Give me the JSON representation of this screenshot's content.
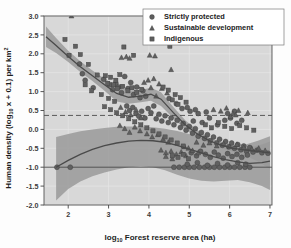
{
  "chart_data": {
    "type": "scatter",
    "title": "",
    "xlabel": "log10 Forest reserve area (ha)",
    "xlabel_main": "log",
    "xlabel_sub": "10",
    "xlabel_rest": " Forest reserve area (ha)",
    "ylabel": "Human density (log10 x + 0.1) per km2",
    "ylabel_part1": "Human density (log",
    "ylabel_sub1": "10",
    "ylabel_part2": " x + 0.1) per km",
    "ylabel_sup": "2",
    "xlim": [
      1.4,
      7.05
    ],
    "ylim": [
      -2.0,
      3.0
    ],
    "xticks": [
      2,
      3,
      4,
      5,
      6,
      7
    ],
    "xtick_labels": [
      "2",
      "3",
      "4",
      "5",
      "6",
      "7"
    ],
    "yticks": [
      -2.0,
      -1.5,
      -1.0,
      -0.5,
      0.0,
      0.5,
      1.0,
      1.5,
      2.0,
      2.5,
      3.0
    ],
    "ytick_labels": [
      "-2.0",
      "-1.5",
      "-1.0",
      "-0.5",
      "0.0",
      "0.5",
      "1.0",
      "1.5",
      "2.0",
      "2.5",
      "3.0"
    ],
    "grid": true,
    "grid_color": "#e8e8e8",
    "plot_bg": "#d8d8d8",
    "legend_position": "top-right",
    "reference_lines": [
      {
        "name": "density-threshold",
        "type": "dashed",
        "y": 0.37,
        "color": "#4a4a4a"
      },
      {
        "name": "zero-density-floor",
        "type": "solid",
        "y": -1.0,
        "color": "#4a4a4a"
      }
    ],
    "legend": [
      {
        "label": "Strictly protected",
        "marker": "circle",
        "color": "#5e5e5e"
      },
      {
        "label": "Sustainable development",
        "marker": "triangle",
        "color": "#5e5e5e"
      },
      {
        "label": "Indigenous",
        "marker": "square",
        "color": "#5e5e5e"
      }
    ],
    "band_color": "#9a9a9a",
    "line_color": "#4a4a4a",
    "trend_upper": {
      "name": "upper-trend",
      "x": [
        1.45,
        1.7,
        2.0,
        2.3,
        2.6,
        2.9,
        3.2,
        3.5,
        3.8,
        4.05,
        4.3,
        4.6,
        4.9,
        5.2,
        5.5,
        5.8,
        6.1,
        6.4,
        6.7,
        7.0
      ],
      "y": [
        2.45,
        2.22,
        1.93,
        1.66,
        1.42,
        1.18,
        0.95,
        0.85,
        0.88,
        0.93,
        0.8,
        0.45,
        0.12,
        -0.12,
        -0.3,
        -0.42,
        -0.5,
        -0.55,
        -0.58,
        -0.62
      ],
      "ci_lo": [
        2.18,
        2.02,
        1.78,
        1.52,
        1.28,
        1.02,
        0.74,
        0.68,
        0.72,
        0.76,
        0.62,
        0.3,
        0.0,
        -0.22,
        -0.38,
        -0.5,
        -0.6,
        -0.7,
        -0.85,
        -1.05
      ],
      "ci_hi": [
        2.72,
        2.42,
        2.08,
        1.8,
        1.56,
        1.34,
        1.16,
        1.02,
        1.04,
        1.1,
        0.98,
        0.6,
        0.24,
        -0.02,
        -0.22,
        -0.34,
        -0.4,
        -0.4,
        -0.3,
        -0.18
      ]
    },
    "trend_lower": {
      "name": "lower-trend",
      "x": [
        1.7,
        2.0,
        2.3,
        2.6,
        2.9,
        3.2,
        3.5,
        3.8,
        4.1,
        4.4,
        4.7,
        5.0,
        5.3,
        5.6,
        5.9,
        6.2,
        6.5,
        6.8,
        7.0
      ],
      "y": [
        -1.0,
        -0.82,
        -0.66,
        -0.53,
        -0.43,
        -0.36,
        -0.31,
        -0.29,
        -0.3,
        -0.34,
        -0.42,
        -0.52,
        -0.62,
        -0.72,
        -0.8,
        -0.86,
        -0.9,
        -0.88,
        -0.84
      ],
      "ci_lo": [
        -1.88,
        -1.58,
        -1.38,
        -1.24,
        -1.14,
        -1.06,
        -1.0,
        -0.98,
        -1.0,
        -1.08,
        -1.2,
        -1.3,
        -1.36,
        -1.38,
        -1.36,
        -1.34,
        -1.4,
        -1.5,
        -1.6
      ],
      "ci_hi": [
        -0.2,
        -0.12,
        -0.05,
        0.0,
        0.04,
        0.07,
        0.08,
        0.08,
        0.06,
        0.02,
        -0.04,
        -0.12,
        -0.22,
        -0.34,
        -0.44,
        -0.5,
        -0.48,
        -0.4,
        -0.32
      ]
    },
    "series": [
      {
        "name": "Strictly protected",
        "marker": "circle",
        "points": [
          [
            1.72,
            -1.0
          ],
          [
            2.05,
            -1.0
          ],
          [
            2.28,
            1.73
          ],
          [
            2.35,
            1.47
          ],
          [
            2.42,
            1.3
          ],
          [
            2.62,
            1.1
          ],
          [
            2.88,
            1.33
          ],
          [
            3.02,
            1.18
          ],
          [
            3.1,
            1.05
          ],
          [
            3.18,
            1.22
          ],
          [
            3.25,
            1.12
          ],
          [
            3.32,
            0.97
          ],
          [
            3.4,
            1.4
          ],
          [
            3.48,
            1.08
          ],
          [
            3.55,
            1.24
          ],
          [
            3.62,
            0.92
          ],
          [
            3.7,
            1.12
          ],
          [
            3.78,
            0.84
          ],
          [
            3.85,
            1.02
          ],
          [
            3.92,
            0.88
          ],
          [
            3.45,
            0.62
          ],
          [
            3.52,
            0.5
          ],
          [
            3.6,
            0.58
          ],
          [
            3.68,
            0.42
          ],
          [
            3.75,
            0.35
          ],
          [
            3.82,
            0.48
          ],
          [
            3.9,
            0.3
          ],
          [
            3.98,
            0.55
          ],
          [
            4.05,
            0.44
          ],
          [
            4.12,
            0.62
          ],
          [
            4.18,
            0.28
          ],
          [
            4.25,
            0.4
          ],
          [
            4.32,
            0.22
          ],
          [
            4.4,
            0.36
          ],
          [
            4.48,
            0.18
          ],
          [
            4.55,
            0.3
          ],
          [
            4.62,
            0.12
          ],
          [
            4.7,
            0.24
          ],
          [
            4.78,
            0.05
          ],
          [
            4.85,
            0.16
          ],
          [
            4.92,
            -0.02
          ],
          [
            5.0,
            0.08
          ],
          [
            5.08,
            -0.1
          ],
          [
            5.15,
            0.02
          ],
          [
            5.22,
            -0.18
          ],
          [
            5.3,
            -0.08
          ],
          [
            5.38,
            -0.24
          ],
          [
            5.45,
            -0.14
          ],
          [
            5.52,
            -0.3
          ],
          [
            5.6,
            -0.2
          ],
          [
            5.68,
            -0.36
          ],
          [
            5.75,
            -0.26
          ],
          [
            5.82,
            -0.42
          ],
          [
            5.9,
            -0.32
          ],
          [
            5.98,
            -0.46
          ],
          [
            6.05,
            -0.36
          ],
          [
            6.12,
            -0.5
          ],
          [
            6.2,
            -0.4
          ],
          [
            6.28,
            -0.54
          ],
          [
            6.35,
            -0.44
          ],
          [
            6.42,
            -0.58
          ],
          [
            6.5,
            -0.48
          ],
          [
            6.58,
            -0.6
          ],
          [
            6.68,
            -0.55
          ],
          [
            6.8,
            -0.62
          ],
          [
            6.95,
            -0.63
          ],
          [
            4.62,
            -1.0
          ],
          [
            4.75,
            -1.0
          ],
          [
            4.88,
            -1.0
          ],
          [
            5.0,
            -1.0
          ],
          [
            5.12,
            -1.0
          ],
          [
            5.25,
            -1.0
          ],
          [
            5.38,
            -1.0
          ],
          [
            5.5,
            -1.0
          ],
          [
            5.62,
            -1.0
          ],
          [
            5.75,
            -1.0
          ],
          [
            5.88,
            -1.0
          ],
          [
            6.0,
            -1.0
          ],
          [
            6.12,
            -1.0
          ],
          [
            6.25,
            -1.0
          ],
          [
            6.38,
            -1.0
          ],
          [
            6.5,
            -1.0
          ],
          [
            4.95,
            -0.92
          ],
          [
            5.2,
            -0.88
          ],
          [
            5.45,
            -0.95
          ],
          [
            5.7,
            -0.9
          ],
          [
            5.95,
            -0.94
          ],
          [
            6.2,
            -0.88
          ],
          [
            6.4,
            -0.92
          ],
          [
            5.05,
            -0.62
          ],
          [
            5.18,
            -0.7
          ],
          [
            5.28,
            -0.58
          ],
          [
            5.4,
            -0.66
          ],
          [
            5.52,
            -0.74
          ],
          [
            5.62,
            -0.6
          ],
          [
            5.72,
            -0.68
          ],
          [
            5.84,
            -0.76
          ],
          [
            5.95,
            -0.64
          ],
          [
            6.06,
            -0.72
          ],
          [
            6.18,
            -0.66
          ],
          [
            6.3,
            -0.74
          ],
          [
            6.44,
            -0.68
          ],
          [
            5.1,
            0.22
          ],
          [
            5.32,
            0.18
          ],
          [
            5.5,
            0.3
          ],
          [
            5.7,
            0.12
          ],
          [
            5.88,
            0.24
          ],
          [
            6.02,
            0.3
          ],
          [
            6.18,
            0.16
          ],
          [
            5.95,
            0.42
          ],
          [
            6.12,
            0.48
          ],
          [
            6.3,
            0.24
          ],
          [
            4.5,
            0.82
          ],
          [
            4.68,
            0.68
          ],
          [
            4.82,
            0.55
          ],
          [
            5.02,
            0.48
          ],
          [
            5.22,
            0.42
          ],
          [
            4.95,
            0.58
          ],
          [
            5.15,
            0.52
          ],
          [
            5.42,
            0.46
          ]
        ]
      },
      {
        "name": "Sustainable development",
        "marker": "triangle",
        "points": [
          [
            2.08,
            3.0
          ],
          [
            3.32,
            1.9
          ],
          [
            3.44,
            1.92
          ],
          [
            3.52,
            1.88
          ],
          [
            4.02,
            1.96
          ],
          [
            4.15,
            1.94
          ],
          [
            4.55,
            1.58
          ],
          [
            3.98,
            1.3
          ],
          [
            4.12,
            1.34
          ],
          [
            4.25,
            1.2
          ],
          [
            4.32,
            1.08
          ],
          [
            4.05,
            1.1
          ],
          [
            3.88,
            1.24
          ],
          [
            4.45,
            0.96
          ],
          [
            4.18,
            0.88
          ],
          [
            3.3,
            0.58
          ],
          [
            3.42,
            0.46
          ],
          [
            3.55,
            0.38
          ],
          [
            3.68,
            0.52
          ],
          [
            3.8,
            0.3
          ],
          [
            3.28,
            0.1
          ],
          [
            3.4,
            0.02
          ],
          [
            3.52,
            -0.08
          ],
          [
            3.65,
            0.06
          ],
          [
            3.78,
            -0.04
          ],
          [
            3.95,
            -0.12
          ],
          [
            4.08,
            -0.2
          ],
          [
            4.22,
            -0.14
          ],
          [
            4.35,
            -0.26
          ],
          [
            4.48,
            -0.34
          ],
          [
            4.3,
            -0.55
          ],
          [
            4.42,
            -0.62
          ],
          [
            4.55,
            -0.58
          ],
          [
            4.68,
            -0.66
          ],
          [
            4.8,
            -0.6
          ],
          [
            4.92,
            -0.7
          ],
          [
            4.42,
            -0.72
          ],
          [
            4.58,
            -0.78
          ],
          [
            5.6,
            0.52
          ],
          [
            5.78,
            0.48
          ],
          [
            5.92,
            0.56
          ],
          [
            6.08,
            0.42
          ],
          [
            6.22,
            0.5
          ],
          [
            6.45,
            0.44
          ],
          [
            6.02,
            0.34
          ],
          [
            6.15,
            0.38
          ],
          [
            5.18,
            -0.34
          ],
          [
            5.35,
            -0.42
          ],
          [
            5.5,
            -0.36
          ],
          [
            5.68,
            -0.44
          ],
          [
            5.85,
            -0.38
          ],
          [
            6.0,
            -0.46
          ],
          [
            6.18,
            -0.4
          ],
          [
            6.35,
            -0.48
          ],
          [
            6.55,
            -0.52
          ],
          [
            6.72,
            -0.5
          ],
          [
            6.88,
            -0.56
          ],
          [
            4.98,
            -0.5
          ],
          [
            5.08,
            -0.56
          ],
          [
            5.22,
            -0.62
          ],
          [
            4.88,
            -0.46
          ]
        ]
      },
      {
        "name": "Indigenous",
        "marker": "square",
        "points": [
          [
            1.92,
            2.38
          ],
          [
            2.02,
            1.96
          ],
          [
            2.18,
            2.2
          ],
          [
            2.3,
            1.98
          ],
          [
            2.5,
            1.72
          ],
          [
            2.72,
            1.44
          ],
          [
            2.92,
            1.42
          ],
          [
            3.05,
            1.38
          ],
          [
            3.18,
            1.3
          ],
          [
            3.28,
            1.45
          ],
          [
            3.38,
            2.18
          ],
          [
            3.62,
            1.96
          ],
          [
            2.98,
            1.22
          ],
          [
            3.12,
            1.18
          ],
          [
            3.22,
            1.08
          ],
          [
            3.35,
            1.14
          ],
          [
            3.48,
            1.02
          ],
          [
            3.58,
            1.1
          ],
          [
            3.7,
            0.98
          ],
          [
            3.82,
            1.06
          ],
          [
            4.52,
            2.2
          ],
          [
            4.35,
            1.12
          ],
          [
            4.48,
            1.04
          ],
          [
            4.65,
            0.92
          ],
          [
            4.78,
            0.84
          ],
          [
            4.92,
            0.72
          ],
          [
            4.58,
            0.78
          ],
          [
            4.72,
            0.66
          ],
          [
            2.42,
            1.18
          ],
          [
            2.58,
            1.02
          ],
          [
            2.82,
            0.92
          ],
          [
            3.0,
            0.82
          ],
          [
            3.15,
            0.74
          ],
          [
            2.9,
            0.6
          ],
          [
            3.05,
            0.52
          ],
          [
            3.2,
            0.44
          ],
          [
            3.35,
            0.36
          ],
          [
            3.5,
            0.28
          ],
          [
            3.65,
            0.2
          ],
          [
            3.8,
            0.12
          ],
          [
            3.95,
            0.04
          ],
          [
            4.1,
            -0.04
          ],
          [
            4.25,
            -0.12
          ],
          [
            4.4,
            -0.2
          ],
          [
            4.55,
            -0.28
          ],
          [
            4.7,
            -0.36
          ],
          [
            4.85,
            -0.44
          ],
          [
            4.58,
            -0.7
          ],
          [
            4.72,
            -0.74
          ],
          [
            4.85,
            -0.66
          ],
          [
            4.98,
            -0.78
          ],
          [
            5.4,
            0.12
          ],
          [
            5.55,
            0.04
          ],
          [
            5.72,
            0.18
          ],
          [
            5.88,
            0.08
          ],
          [
            6.05,
            0.02
          ],
          [
            6.25,
            0.1
          ],
          [
            6.42,
            0.04
          ],
          [
            6.6,
            -0.02
          ]
        ]
      }
    ]
  }
}
